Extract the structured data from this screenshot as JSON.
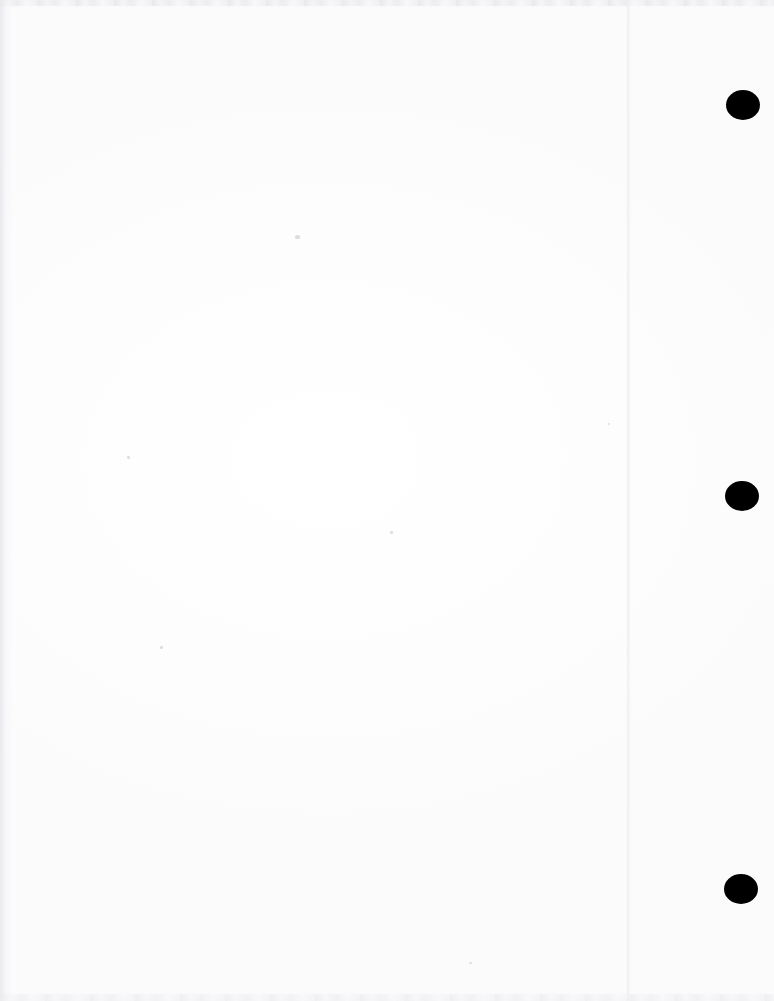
{
  "document": {
    "kind": "scanned-page",
    "page_label": "",
    "content_text": "",
    "background_color": "#ffffff",
    "ink_color": "#000000",
    "width": 774,
    "height": 1001,
    "is_blank": true
  },
  "binder_holes": {
    "count": 3,
    "color": "#000000",
    "side": "right",
    "items": [
      {
        "name": "top",
        "cx": 743,
        "cy": 105,
        "rx": 17,
        "ry": 15
      },
      {
        "name": "middle",
        "cx": 742,
        "cy": 496,
        "rx": 17,
        "ry": 15
      },
      {
        "name": "bottom",
        "cx": 741,
        "cy": 889,
        "rx": 17,
        "ry": 15
      }
    ]
  },
  "artifacts": {
    "fold_line": {
      "x": 628,
      "color": "#ecedf0"
    },
    "top_band": {
      "height": 6,
      "color": "#e8e8ec"
    },
    "bottom_band": {
      "height": 7,
      "color": "#ededf1"
    },
    "left_edge": {
      "width": 13,
      "color": "#e9e9ed"
    },
    "specks": [
      {
        "x": 295,
        "y": 235,
        "w": 5,
        "h": 4
      },
      {
        "x": 127,
        "y": 456,
        "w": 3,
        "h": 3
      },
      {
        "x": 390,
        "y": 531,
        "w": 3,
        "h": 3
      },
      {
        "x": 160,
        "y": 646,
        "w": 3,
        "h": 3
      },
      {
        "x": 608,
        "y": 423,
        "w": 2,
        "h": 2
      },
      {
        "x": 469,
        "y": 962,
        "w": 3,
        "h": 2
      }
    ]
  }
}
